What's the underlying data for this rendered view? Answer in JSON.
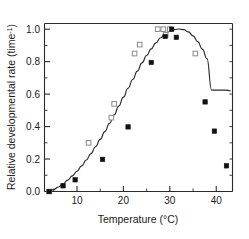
{
  "chart_data": {
    "type": "scatter",
    "title": "",
    "xlabel": "Temperature  (°C)",
    "ylabel": "Relative developmental rate (time",
    "ylabel_superscript": "-1",
    "ylabel_suffix": ")",
    "xlim": [
      3,
      43.5
    ],
    "ylim": [
      0,
      1.035
    ],
    "grid": false,
    "legend": "none",
    "x_ticks": [
      10,
      20,
      30,
      40
    ],
    "x_tick_labels": [
      "10",
      "20",
      "30",
      "40"
    ],
    "x_minor_ticks": [
      5,
      15,
      25,
      35
    ],
    "y_ticks": [
      0.0,
      0.2,
      0.4,
      0.6,
      0.8,
      1.0
    ],
    "y_tick_labels": [
      "0.0",
      "0.2",
      "0.4",
      "0.6",
      "0.8",
      "1.0"
    ],
    "y_minor_ticks": [
      0.1,
      0.3,
      0.5,
      0.7,
      0.9
    ],
    "colors": {
      "axis": "#2b2b2b",
      "curve": "#2b2b2b",
      "open_marker_edge": "#8a8a8a",
      "open_marker_fill": "#ffffff",
      "filled_marker": "#111111"
    },
    "series": [
      {
        "name": "open-squares",
        "marker": "open-square",
        "points": [
          [
            4.0,
            0.0
          ],
          [
            12.5,
            0.3
          ],
          [
            17.4,
            0.455
          ],
          [
            18.0,
            0.54
          ],
          [
            22.4,
            0.85
          ],
          [
            23.5,
            0.905
          ],
          [
            27.4,
            1.0
          ],
          [
            28.6,
            1.0
          ],
          [
            29.1,
            0.965
          ],
          [
            30.0,
            1.0
          ],
          [
            35.5,
            0.85
          ]
        ]
      },
      {
        "name": "filled-squares",
        "marker": "filled-square",
        "points": [
          [
            4.0,
            0.0
          ],
          [
            7.0,
            0.035
          ],
          [
            9.6,
            0.072
          ],
          [
            15.5,
            0.198
          ],
          [
            21.0,
            0.398
          ],
          [
            26.0,
            0.795
          ],
          [
            29.0,
            0.955
          ],
          [
            30.4,
            1.0
          ],
          [
            31.4,
            0.95
          ],
          [
            37.6,
            0.552
          ],
          [
            39.6,
            0.372
          ],
          [
            42.2,
            0.158
          ]
        ]
      }
    ],
    "fit_curve": {
      "name": "fitted-model-curve",
      "points": [
        [
          4.0,
          0.0
        ],
        [
          5.0,
          0.012
        ],
        [
          6.0,
          0.028
        ],
        [
          7.0,
          0.047
        ],
        [
          8.0,
          0.07
        ],
        [
          9.0,
          0.096
        ],
        [
          10.0,
          0.125
        ],
        [
          11.0,
          0.158
        ],
        [
          12.0,
          0.194
        ],
        [
          13.0,
          0.233
        ],
        [
          14.0,
          0.276
        ],
        [
          15.0,
          0.321
        ],
        [
          16.0,
          0.369
        ],
        [
          17.0,
          0.42
        ],
        [
          18.0,
          0.472
        ],
        [
          19.0,
          0.526
        ],
        [
          20.0,
          0.581
        ],
        [
          21.0,
          0.636
        ],
        [
          22.0,
          0.69
        ],
        [
          23.0,
          0.742
        ],
        [
          24.0,
          0.792
        ],
        [
          25.0,
          0.838
        ],
        [
          26.0,
          0.879
        ],
        [
          27.0,
          0.916
        ],
        [
          28.0,
          0.947
        ],
        [
          29.0,
          0.971
        ],
        [
          30.0,
          0.988
        ],
        [
          31.0,
          0.998
        ],
        [
          32.0,
          1.001
        ],
        [
          33.0,
          0.997
        ],
        [
          34.0,
          0.983
        ],
        [
          35.0,
          0.959
        ],
        [
          36.0,
          0.923
        ],
        [
          37.0,
          0.877
        ],
        [
          38.0,
          0.819
        ],
        [
          39.0,
          0.625
        ],
        [
          40.0,
          0.625
        ],
        [
          41.0,
          0.625
        ],
        [
          42.0,
          0.625
        ],
        [
          43.0,
          0.621
        ]
      ]
    }
  }
}
